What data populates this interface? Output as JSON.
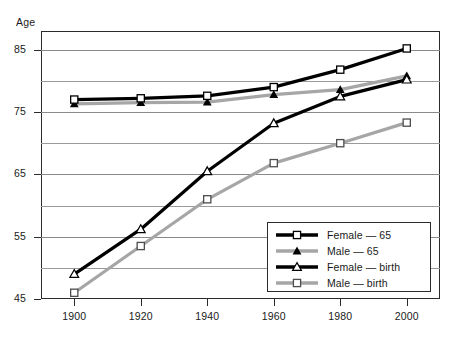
{
  "chart_data": {
    "type": "line",
    "title": "",
    "subtitle": "",
    "xlabel": "",
    "ylabel": "Age",
    "x": [
      1900,
      1920,
      1940,
      1960,
      1980,
      2000
    ],
    "categories": [
      "1900",
      "1920",
      "1940",
      "1960",
      "1980",
      "2000"
    ],
    "xlim": [
      1890,
      2010
    ],
    "ylim": [
      45,
      88
    ],
    "yticks": [
      45,
      55,
      65,
      75,
      85
    ],
    "yticklabels": [
      "45",
      "55",
      "65",
      "75",
      "85"
    ],
    "yminorticks": [
      50,
      60,
      70,
      80
    ],
    "grid": true,
    "grid_axis": "y",
    "legend_position": "lower right",
    "series": [
      {
        "name": "Female — 65",
        "color": "#000000",
        "marker": "square-open",
        "values": [
          77,
          77.2,
          77.6,
          79,
          81.8,
          85.2
        ]
      },
      {
        "name": "Male — 65",
        "color": "#a6a6a6",
        "marker": "triangle-filled",
        "values": [
          76.3,
          76.5,
          76.6,
          77.8,
          78.6,
          80.8
        ]
      },
      {
        "name": "Female — birth",
        "color": "#000000",
        "marker": "triangle-open",
        "values": [
          49,
          56.2,
          65.5,
          73.2,
          77.5,
          80.2
        ]
      },
      {
        "name": "Male — birth",
        "color": "#a6a6a6",
        "marker": "square-open",
        "values": [
          46,
          53.5,
          61,
          66.8,
          70,
          73.3
        ]
      }
    ]
  },
  "axis": {
    "y_title": "Age"
  },
  "legend": {
    "items": [
      {
        "label": "Female — 65",
        "swatch": "black-line-square-open-marker"
      },
      {
        "label": "Male — 65",
        "swatch": "gray-line-triangle-filled-marker"
      },
      {
        "label": "Female — birth",
        "swatch": "black-line-triangle-open-marker"
      },
      {
        "label": "Male — birth",
        "swatch": "gray-line-square-open-marker"
      }
    ]
  }
}
